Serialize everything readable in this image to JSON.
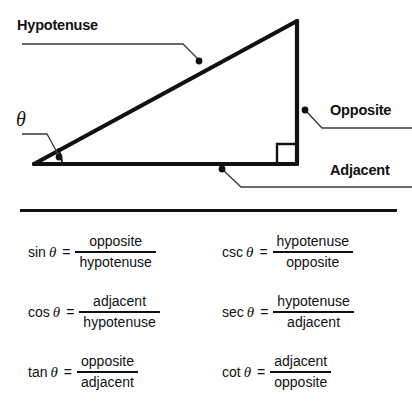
{
  "diagram": {
    "angle_symbol": "θ",
    "labels": {
      "hypotenuse": "Hypotenuse",
      "opposite": "Opposite",
      "adjacent": "Adjacent"
    },
    "colors": {
      "ink": "#111111",
      "leader": "#3a3a3a",
      "background": "#ffffff"
    },
    "geometry": {
      "vertex_left": [
        34,
        164
      ],
      "vertex_apex": [
        297,
        21
      ],
      "vertex_right": [
        297,
        164
      ],
      "right_angle_marker": [
        277,
        144,
        20,
        20
      ],
      "angle_arc_radius": 26
    }
  },
  "divider": {
    "present": "true"
  },
  "formulas": {
    "rows": [
      {
        "left": {
          "fn": "sin",
          "theta": "θ",
          "eq": "=",
          "numerator": "opposite",
          "denominator": "hypotenuse"
        },
        "right": {
          "fn": "csc",
          "theta": "θ",
          "eq": "=",
          "numerator": "hypotenuse",
          "denominator": "opposite"
        }
      },
      {
        "left": {
          "fn": "cos",
          "theta": "θ",
          "eq": "=",
          "numerator": "adjacent",
          "denominator": "hypotenuse"
        },
        "right": {
          "fn": "sec",
          "theta": "θ",
          "eq": "=",
          "numerator": "hypotenuse",
          "denominator": "adjacent"
        }
      },
      {
        "left": {
          "fn": "tan",
          "theta": "θ",
          "eq": "=",
          "numerator": "opposite",
          "denominator": "adjacent"
        },
        "right": {
          "fn": "cot",
          "theta": "θ",
          "eq": "=",
          "numerator": "adjacent",
          "denominator": "opposite"
        }
      }
    ]
  }
}
